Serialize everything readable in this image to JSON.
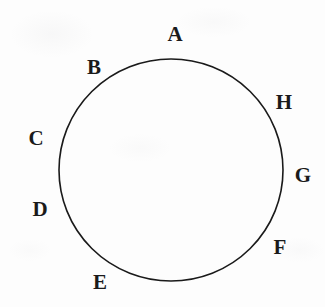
{
  "figure": {
    "type": "circle-with-labeled-points",
    "background_color": "#fdfdfd",
    "stroke_color": "#1a1a1a",
    "label_color": "#1a1a1a",
    "circle": {
      "center_x": 171,
      "center_y": 170,
      "radius_x": 112,
      "radius_y": 111,
      "stroke_width": 1.6,
      "fill": "none"
    },
    "labels": [
      {
        "text": "A",
        "x": 175,
        "y": 34
      },
      {
        "text": "B",
        "x": 94,
        "y": 67
      },
      {
        "text": "C",
        "x": 36,
        "y": 138
      },
      {
        "text": "D",
        "x": 40,
        "y": 209
      },
      {
        "text": "E",
        "x": 100,
        "y": 282
      },
      {
        "text": "F",
        "x": 280,
        "y": 247
      },
      {
        "text": "G",
        "x": 303,
        "y": 175
      },
      {
        "text": "H",
        "x": 284,
        "y": 102
      }
    ]
  }
}
